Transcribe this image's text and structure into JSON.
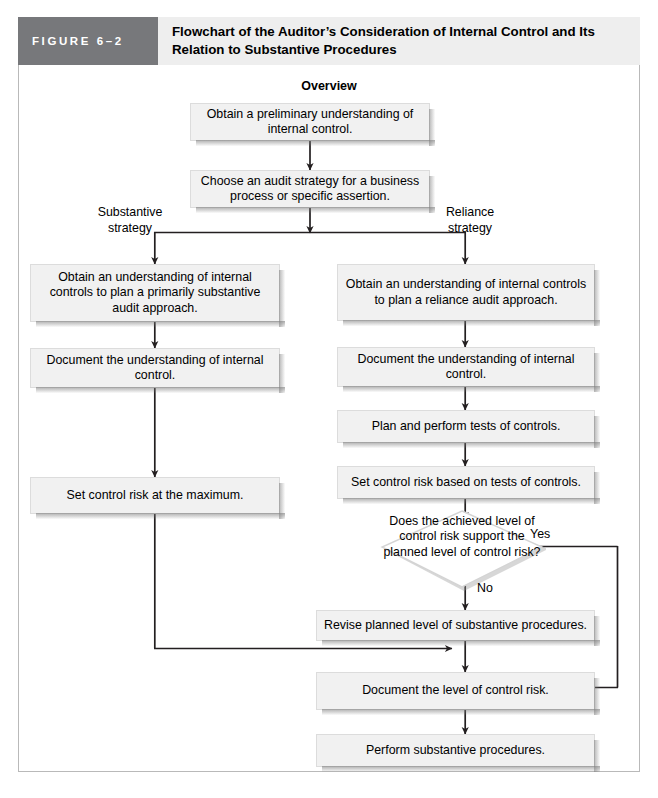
{
  "figure": {
    "number_label": "FIGURE 6–2",
    "title": "Flowchart of the Auditor’s Consideration of Internal Control and Its Relation to Substantive Procedures",
    "section_heading": "Overview",
    "accent_color": "#77787b",
    "title_bg_color": "#eeeeee",
    "node_fill_color": "#f1f1f1",
    "line_color": "#231f20"
  },
  "nodes": {
    "obtain_preliminary": "Obtain a preliminary understanding of internal control.",
    "choose_strategy": "Choose an audit strategy for a business process or specific assertion.",
    "substantive_understanding": "Obtain an understanding of internal controls to plan a primarily substantive audit approach.",
    "substantive_document": "Document the understanding of internal control.",
    "substantive_set_max": "Set control risk at the maximum.",
    "reliance_understanding": "Obtain an understanding of internal controls to plan a reliance audit approach.",
    "reliance_document": "Document the understanding of internal control.",
    "plan_perform_tests": "Plan and perform tests of controls.",
    "set_control_risk_tests": "Set control risk based on tests of controls.",
    "decision_achieved_level": "Does the achieved level of control risk support the planned level of control risk?",
    "revise_planned_level": "Revise planned level of substantive procedures.",
    "document_level_risk": "Document the level of control risk.",
    "perform_substantive": "Perform substantive procedures."
  },
  "edge_labels": {
    "substantive_branch": "Substantive\nstrategy",
    "reliance_branch": "Reliance\nstrategy",
    "decision_yes": "Yes",
    "decision_no": "No"
  }
}
